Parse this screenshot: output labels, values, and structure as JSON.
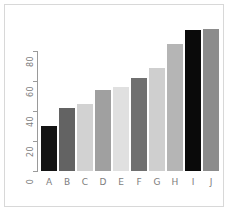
{
  "chart_data": {
    "type": "bar",
    "title": "",
    "xlabel": "",
    "ylabel": "",
    "categories": [
      "A",
      "B",
      "C",
      "D",
      "E",
      "F",
      "G",
      "H",
      "I",
      "J"
    ],
    "values": [
      30,
      42,
      45,
      54,
      56,
      62,
      69,
      85,
      94,
      95
    ],
    "bar_colors": [
      "#141414",
      "#636363",
      "#d2d2d2",
      "#a0a0a0",
      "#e0e0e0",
      "#707070",
      "#cfcfcf",
      "#b5b5b5",
      "#0a0a0a",
      "#8c8c8c"
    ],
    "ylim": [
      0,
      95
    ],
    "yticks": [
      0,
      20,
      40,
      60,
      80
    ],
    "ytick_labels": [
      "0",
      "20",
      "40",
      "60",
      "80"
    ],
    "grid": false,
    "legend": false,
    "axis_color": "#9a9a9a",
    "label_color": "#7d7d7d",
    "frame_color": "#d8d8d8",
    "background": "#ffffff"
  }
}
